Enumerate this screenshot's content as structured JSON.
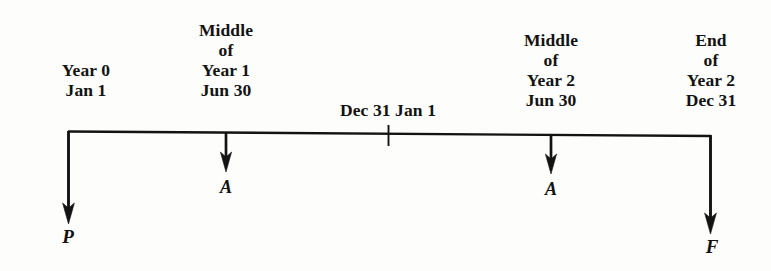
{
  "diagram": {
    "type": "cash-flow-timeline",
    "title": "",
    "background_color": "#fdfdfc",
    "ink_color": "#131313",
    "timeline": {
      "start_x": 68,
      "end_x": 711,
      "y_left": 131,
      "y_right": 136,
      "tick": {
        "label": "Dec 31 Jan 1",
        "x": 388
      }
    },
    "period_labels": [
      {
        "id": "year-0",
        "lines": [
          "Year 0",
          "Jan 1"
        ],
        "x": 86,
        "y": 60,
        "align": "center"
      },
      {
        "id": "middle-year-1",
        "lines": [
          "Middle",
          "of",
          "Year 1",
          "Jun 30"
        ],
        "x": 226,
        "y": 20,
        "align": "center"
      },
      {
        "id": "year-boundary",
        "lines": [
          "Dec 31 Jan 1"
        ],
        "x": 388,
        "y": 100,
        "align": "center"
      },
      {
        "id": "middle-year-2",
        "lines": [
          "Middle",
          "of",
          "Year 2",
          "Jun 30"
        ],
        "x": 551,
        "y": 30,
        "align": "center"
      },
      {
        "id": "end-year-2",
        "lines": [
          "End",
          "of",
          "Year 2",
          "Dec 31"
        ],
        "x": 711,
        "y": 30,
        "align": "center"
      }
    ],
    "cash_flows": [
      {
        "id": "P",
        "symbol": "P",
        "meaning": "present-worth",
        "x": 68,
        "top_y": 131,
        "tip_y": 223,
        "label_x": 68,
        "label_y": 228,
        "direction": "down"
      },
      {
        "id": "A1",
        "symbol": "A",
        "meaning": "annual-amount-year-1",
        "x": 226,
        "top_y": 133,
        "tip_y": 171,
        "label_x": 226,
        "label_y": 178,
        "direction": "down"
      },
      {
        "id": "A2",
        "symbol": "A",
        "meaning": "annual-amount-year-2",
        "x": 551,
        "top_y": 135,
        "tip_y": 173,
        "label_x": 551,
        "label_y": 180,
        "direction": "down"
      },
      {
        "id": "F",
        "symbol": "F",
        "meaning": "future-worth",
        "x": 711,
        "top_y": 136,
        "tip_y": 233,
        "label_x": 712,
        "label_y": 238,
        "direction": "down"
      }
    ]
  }
}
